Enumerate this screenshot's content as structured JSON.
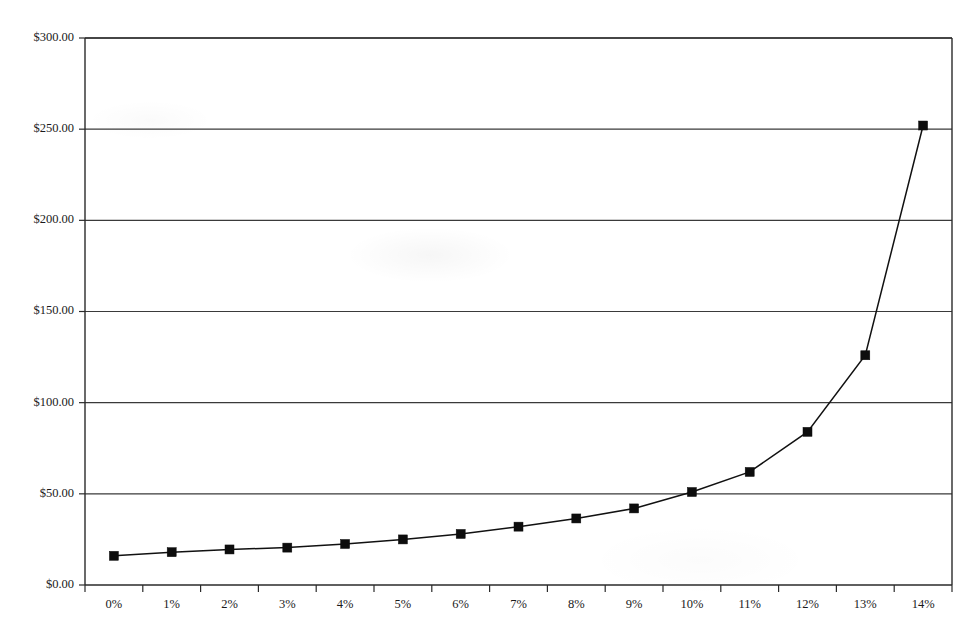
{
  "chart_data": {
    "type": "line",
    "title": "",
    "subtitle": "",
    "xlabel": "",
    "ylabel": "",
    "categories": [
      "0%",
      "1%",
      "2%",
      "3%",
      "4%",
      "5%",
      "6%",
      "7%",
      "8%",
      "9%",
      "10%",
      "11%",
      "12%",
      "13%",
      "14%"
    ],
    "values": [
      16.0,
      18.0,
      19.5,
      20.5,
      22.5,
      25.0,
      28.0,
      32.0,
      36.5,
      42.0,
      51.0,
      62.0,
      84.0,
      126.0,
      252.0
    ],
    "series": [
      {
        "name": "",
        "values": [
          16.0,
          18.0,
          19.5,
          20.5,
          22.5,
          25.0,
          28.0,
          32.0,
          36.5,
          42.0,
          51.0,
          62.0,
          84.0,
          126.0,
          252.0
        ]
      }
    ],
    "ylim": [
      0,
      300
    ],
    "ytick_values": [
      0,
      50,
      100,
      150,
      200,
      250,
      300
    ],
    "ytick_labels": [
      "$0.00",
      "$50.00",
      "$100.00",
      "$150.00",
      "$200.00",
      "$250.00",
      "$300.00"
    ],
    "xtick_labels": [
      "0%",
      "1%",
      "2%",
      "3%",
      "4%",
      "5%",
      "6%",
      "7%",
      "8%",
      "9%",
      "10%",
      "11%",
      "12%",
      "13%",
      "14%"
    ],
    "grid": "horizontal",
    "legend": "none",
    "marker": "square",
    "marker_color": "#0d0d0d",
    "line_color": "#111111",
    "grid_color": "#3a3a3a",
    "axis_color": "#2a2a2a",
    "background_color": "#ffffff"
  },
  "plot": {
    "left": 85,
    "right": 952,
    "top": 38,
    "bottom": 585
  }
}
